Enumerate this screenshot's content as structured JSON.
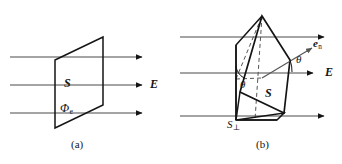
{
  "figure": {
    "width": 342,
    "height": 164,
    "background": "#ffffff",
    "stroke_color": "#141414",
    "field_line_color": "#4a4a4a"
  },
  "panel_a": {
    "caption": "(a)",
    "labels": {
      "surface": "S",
      "flux": "Φ",
      "flux_subscript": "e",
      "field": "E"
    },
    "field_lines": [
      {
        "y": 57,
        "x1": 10,
        "x2": 148
      },
      {
        "y": 85,
        "x1": 10,
        "x2": 148
      },
      {
        "y": 113,
        "x1": 10,
        "x2": 148
      }
    ],
    "surface_polygon": "55,60 103,37 103,105 55,128"
  },
  "panel_b": {
    "caption": "(b)",
    "labels": {
      "surface": "S",
      "projected_surface": "S",
      "projected_subscript": "⊥",
      "normal": "e",
      "normal_subscript": "n",
      "angle_upper": "θ",
      "angle_lower": "θ",
      "field": "E"
    },
    "field_lines": [
      {
        "y": 37,
        "x1": 180,
        "x2": 330
      },
      {
        "y": 73,
        "x1": 180,
        "x2": 320
      },
      {
        "y": 116,
        "x1": 180,
        "x2": 330
      }
    ],
    "angle_degrees": "θ"
  },
  "colors": {
    "ink": "#141414",
    "field_line": "#4a4a4a",
    "dashed": "#555555"
  }
}
